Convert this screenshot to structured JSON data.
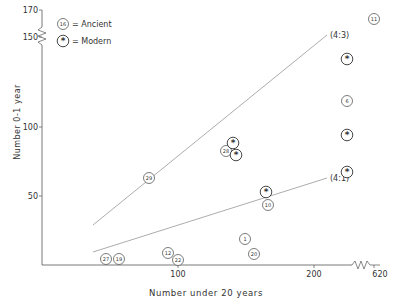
{
  "chart_data": {
    "type": "scatter",
    "title": "",
    "xlabel": "Number under 20 years",
    "ylabel": "Number 0-1 year",
    "x_ticks": [
      "100",
      "200",
      "620"
    ],
    "y_ticks": [
      "50",
      "100",
      "150",
      "170"
    ],
    "xlim": [
      0,
      620
    ],
    "ylim": [
      0,
      170
    ],
    "axis_breaks": {
      "x": "between 200 and 620",
      "y": "between 150 and 170"
    },
    "grid": false,
    "legend": {
      "position": "top-left",
      "entries": [
        {
          "symbol": "circled number",
          "sample": "16",
          "label": "= Ancient"
        },
        {
          "symbol": "circled asterisk",
          "sample": "*",
          "label": "= Modern"
        }
      ]
    },
    "reference_lines": [
      {
        "label": "(4:3)",
        "x": [
          40,
          215
        ],
        "y": [
          30,
          167
        ]
      },
      {
        "label": "(4:1)",
        "x": [
          40,
          215
        ],
        "y": [
          10,
          63
        ]
      }
    ],
    "series": [
      {
        "name": "Ancient",
        "points": [
          {
            "id": "11",
            "x": 620,
            "y": 170
          },
          {
            "id": "6",
            "x": 222,
            "y": 118
          },
          {
            "id": "29",
            "x": 79,
            "y": 63
          },
          {
            "id": "28",
            "x": 135,
            "y": 82
          },
          {
            "id": "10",
            "x": 167,
            "y": 44
          },
          {
            "id": "1",
            "x": 150,
            "y": 19
          },
          {
            "id": "20",
            "x": 156,
            "y": 8
          },
          {
            "id": "12",
            "x": 93,
            "y": 9
          },
          {
            "id": "22",
            "x": 100,
            "y": 4
          },
          {
            "id": "27",
            "x": 47,
            "y": 5
          },
          {
            "id": "19",
            "x": 57,
            "y": 5
          }
        ]
      },
      {
        "name": "Modern",
        "points": [
          {
            "id": "*",
            "x": 222,
            "y": 149
          },
          {
            "id": "*",
            "x": 222,
            "y": 94
          },
          {
            "id": "*",
            "x": 222,
            "y": 68
          },
          {
            "id": "*",
            "x": 140,
            "y": 88
          },
          {
            "id": "*",
            "x": 143,
            "y": 80
          },
          {
            "id": "*",
            "x": 165,
            "y": 53
          }
        ]
      }
    ]
  },
  "render": {
    "x_axis": {
      "y": 265,
      "x0": 42,
      "x1": 355
    },
    "y_axis": {
      "x": 42,
      "y0": 10,
      "y1": 265
    },
    "x_tick_px": [
      {
        "label": "100",
        "px": 178
      },
      {
        "label": "200",
        "px": 314
      },
      {
        "label": "620",
        "px": 374
      }
    ],
    "y_tick_px": [
      {
        "label": "50",
        "py": 196
      },
      {
        "label": "100",
        "py": 127
      },
      {
        "label": "150",
        "py": 37
      },
      {
        "label": "170",
        "py": 10
      }
    ],
    "lines": [
      {
        "label": "(4:3)",
        "x1": 93,
        "y1": 225,
        "x2": 327,
        "y2": 35,
        "lx": 330,
        "ly": 38
      },
      {
        "label": "(4:1)",
        "x1": 93,
        "y1": 252,
        "x2": 327,
        "y2": 178,
        "lx": 330,
        "ly": 181
      }
    ],
    "ancient_px": [
      {
        "id": "11",
        "cx": 374,
        "cy": 19
      },
      {
        "id": "6",
        "cx": 347,
        "cy": 101
      },
      {
        "id": "29",
        "cx": 149,
        "cy": 178
      },
      {
        "id": "28",
        "cx": 226,
        "cy": 151
      },
      {
        "id": "10",
        "cx": 268,
        "cy": 205
      },
      {
        "id": "1",
        "cx": 245,
        "cy": 239
      },
      {
        "id": "20",
        "cx": 254,
        "cy": 254
      },
      {
        "id": "12",
        "cx": 168,
        "cy": 253
      },
      {
        "id": "22",
        "cx": 178,
        "cy": 260
      },
      {
        "id": "27",
        "cx": 106,
        "cy": 259
      },
      {
        "id": "19",
        "cx": 119,
        "cy": 259
      }
    ],
    "modern_px": [
      {
        "cx": 347,
        "cy": 59
      },
      {
        "cx": 347,
        "cy": 135
      },
      {
        "cx": 347,
        "cy": 172
      },
      {
        "cx": 233,
        "cy": 143
      },
      {
        "cx": 236,
        "cy": 155
      },
      {
        "cx": 266,
        "cy": 192
      }
    ]
  }
}
